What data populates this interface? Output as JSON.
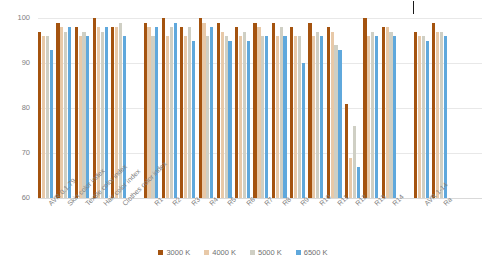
{
  "chart_data": {
    "type": "bar",
    "title": "",
    "xlabel": "",
    "ylabel": "CRI index",
    "ylim": [
      60,
      100
    ],
    "yticks": [
      60,
      70,
      80,
      90,
      100
    ],
    "grid": true,
    "legend_position": "bottom",
    "categories": [
      "AVR 0.1.79",
      "Skin color index",
      "Textile color index",
      "Hair color index",
      "Clothes color index",
      "R1",
      "R2",
      "R3",
      "R4",
      "R5",
      "R6",
      "R7",
      "R8",
      "R9",
      "R10",
      "R11",
      "R12",
      "R13",
      "R14",
      "AVR 1-14",
      "Ra"
    ],
    "group_breaks": [
      5,
      19
    ],
    "series": [
      {
        "name": "3000 K",
        "color": "#A4530F",
        "values": [
          97,
          99,
          98,
          100,
          98,
          99,
          100,
          98,
          100,
          99,
          98,
          99,
          99,
          98,
          99,
          98,
          81,
          100,
          98,
          97,
          99
        ]
      },
      {
        "name": "4000 K",
        "color": "#E8C9A8",
        "values": [
          96,
          98,
          96,
          98,
          98,
          98,
          96,
          96,
          99,
          97,
          96,
          98,
          96,
          96,
          96,
          97,
          69,
          96,
          98,
          96,
          97
        ]
      },
      {
        "name": "5000 K",
        "color": "#CFCFC4",
        "values": [
          96,
          97,
          97,
          97,
          99,
          96,
          98,
          98,
          96,
          96,
          97,
          96,
          98,
          96,
          97,
          94,
          76,
          97,
          97,
          96,
          97
        ]
      },
      {
        "name": "6500 K",
        "color": "#5FA8DC",
        "values": [
          93,
          98,
          96,
          98,
          96,
          98,
          99,
          95,
          98,
          95,
          95,
          96,
          96,
          90,
          96,
          93,
          67,
          96,
          96,
          95,
          96
        ]
      }
    ],
    "legend": [
      {
        "label": "3000 K",
        "color": "#A4530F"
      },
      {
        "label": "4000 K",
        "color": "#E8C9A8"
      },
      {
        "label": "5000 K",
        "color": "#CFCFC4"
      },
      {
        "label": "6500 K",
        "color": "#5FA8DC"
      }
    ]
  }
}
